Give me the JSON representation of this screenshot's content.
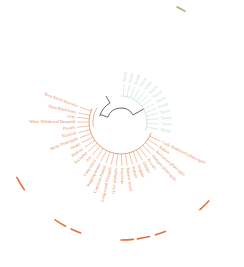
{
  "diagram": {
    "type": "circular-phylogenetic-tree",
    "center": [
      121,
      122
    ],
    "colors": {
      "orange_clade": "#e8865a",
      "green_clade": "#b9dcc6",
      "root_branch": "#555555",
      "outer_arc_orange": "#e3703f",
      "outer_arc_green": "#9bb86a",
      "background": "#ffffff"
    },
    "orange_labels": [
      {
        "text": "Rare Aerial Australia",
        "angle": 200
      },
      {
        "text": "Plain Blackfriars",
        "angle": 192
      },
      {
        "text": "Gray",
        "angle": 186
      },
      {
        "text": "White Whiskered Dasyurid",
        "angle": 180
      },
      {
        "text": "Dwarfs",
        "angle": 173
      },
      {
        "text": "Blackish",
        "angle": 166
      },
      {
        "text": "Spiny Phascogale",
        "angle": 159
      },
      {
        "text": "Dusky",
        "angle": 152
      },
      {
        "text": "Bird Isl.",
        "angle": 145
      },
      {
        "text": "Fat tailed",
        "angle": 138
      },
      {
        "text": "Ant",
        "angle": 131
      },
      {
        "text": "Long tailed",
        "angle": 124
      },
      {
        "text": "Hopping mouse",
        "angle": 117
      },
      {
        "text": "Common dunnart",
        "angle": 110
      },
      {
        "text": "Long-eared Planigale",
        "angle": 103
      },
      {
        "text": "Giles' planigale",
        "angle": 96
      },
      {
        "text": "Paucident",
        "angle": 89
      },
      {
        "text": "Narrow-nosed",
        "angle": 82
      },
      {
        "text": "Kultarr",
        "angle": 75
      },
      {
        "text": "Ningaui",
        "angle": 68
      },
      {
        "text": "Dibbler",
        "angle": 61
      },
      {
        "text": "Kowari",
        "angle": 54
      },
      {
        "text": "Mulgara phascogale",
        "angle": 47
      },
      {
        "text": "Red-tailed phascogale",
        "angle": 40
      },
      {
        "text": "Kaluta",
        "angle": 33
      },
      {
        "text": "Lady Anderson's phascogale",
        "angle": 26
      }
    ],
    "green_labels": [
      {
        "text": "Taxon",
        "angle": 275
      },
      {
        "text": "Taxon",
        "angle": 283
      },
      {
        "text": "Taxon",
        "angle": 291
      },
      {
        "text": "Taxon",
        "angle": 299
      },
      {
        "text": "Taxon",
        "angle": 307
      },
      {
        "text": "Taxon",
        "angle": 315
      },
      {
        "text": "Taxon",
        "angle": 323
      },
      {
        "text": "Taxon",
        "angle": 331
      },
      {
        "text": "Taxon",
        "angle": 339
      },
      {
        "text": "Taxon",
        "angle": 347
      },
      {
        "text": "Taxon",
        "angle": 355
      },
      {
        "text": "Taxon",
        "angle": 3
      },
      {
        "text": "Taxon",
        "angle": 11
      }
    ],
    "outer_arcs": [
      {
        "color": "orange",
        "from": 145,
        "to": 152
      },
      {
        "color": "orange",
        "from": 118,
        "to": 124
      },
      {
        "color": "orange",
        "from": 110,
        "to": 115
      },
      {
        "color": "orange",
        "from": 84,
        "to": 90
      },
      {
        "color": "orange",
        "from": 76,
        "to": 82
      },
      {
        "color": "orange",
        "from": 68,
        "to": 73
      },
      {
        "color": "orange",
        "from": 42,
        "to": 48
      },
      {
        "color": "green",
        "from": 296,
        "to": 300
      }
    ]
  }
}
